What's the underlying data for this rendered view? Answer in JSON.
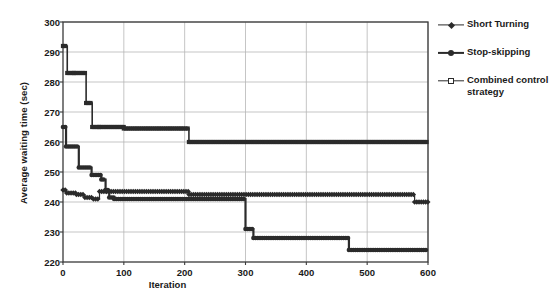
{
  "chart_data": {
    "type": "line",
    "title": "",
    "xlabel": "Iteration",
    "ylabel": "Average waiting time (sec)",
    "xlim": [
      0,
      600
    ],
    "ylim": [
      220,
      300
    ],
    "xticks": [
      0,
      100,
      200,
      300,
      400,
      500,
      600
    ],
    "yticks": [
      220,
      230,
      240,
      250,
      260,
      270,
      280,
      290,
      300
    ],
    "grid": true,
    "legend_position": "right",
    "series": [
      {
        "name": "Short Turning",
        "marker": "diamond",
        "color": "#2b2b2b",
        "line_width": 1.2,
        "x": [
          0,
          6,
          6,
          22,
          22,
          36,
          36,
          50,
          50,
          60,
          60,
          72,
          72,
          207,
          207,
          578,
          578,
          600
        ],
        "y": [
          244,
          244,
          243,
          243,
          242.5,
          242.5,
          241.5,
          241.5,
          241,
          241,
          243.5,
          243.5,
          243.5,
          243.5,
          242.5,
          242.5,
          240,
          240
        ]
      },
      {
        "name": "Stop-skipping",
        "marker": "circle",
        "color": "#2b2b2b",
        "line_width": 2.2,
        "x": [
          0,
          5,
          5,
          26,
          26,
          47,
          47,
          63,
          63,
          70,
          70,
          76,
          76,
          84,
          84,
          300,
          300,
          313,
          313,
          470,
          470,
          600
        ],
        "y": [
          265,
          265,
          258.5,
          258.5,
          251.5,
          251.5,
          249,
          249,
          247.5,
          247.5,
          244,
          244,
          241.5,
          241.5,
          241,
          241,
          231,
          231,
          228,
          228,
          224,
          224
        ]
      },
      {
        "name": "Combined control strategy",
        "marker": "square",
        "color": "#2b2b2b",
        "line_width": 1.6,
        "x": [
          0,
          7,
          7,
          18,
          18,
          38,
          38,
          48,
          48,
          60,
          60,
          100,
          100,
          207,
          207,
          600
        ],
        "y": [
          292,
          292,
          283,
          283,
          283,
          283,
          273,
          273,
          265,
          265,
          265,
          265,
          264.5,
          264.5,
          260,
          260
        ]
      }
    ]
  },
  "axes": {
    "ylabel": "Average waiting time (sec)",
    "xlabel": "Iteration",
    "yticks": [
      "300",
      "290",
      "280",
      "270",
      "260",
      "250",
      "240",
      "230",
      "220"
    ],
    "xticks": [
      "0",
      "100",
      "200",
      "300",
      "400",
      "500",
      "600"
    ]
  },
  "legend": {
    "items": [
      {
        "label": "Short Turning",
        "marker": "diamond-marker"
      },
      {
        "label": "Stop-skipping",
        "marker": "circle-marker"
      },
      {
        "label": "Combined control strategy",
        "marker": "square-marker"
      }
    ]
  },
  "colors": {
    "series": "#2b2b2b",
    "grid": "#b6b6b6",
    "axis": "#3a3a3a",
    "background": "#ffffff"
  }
}
